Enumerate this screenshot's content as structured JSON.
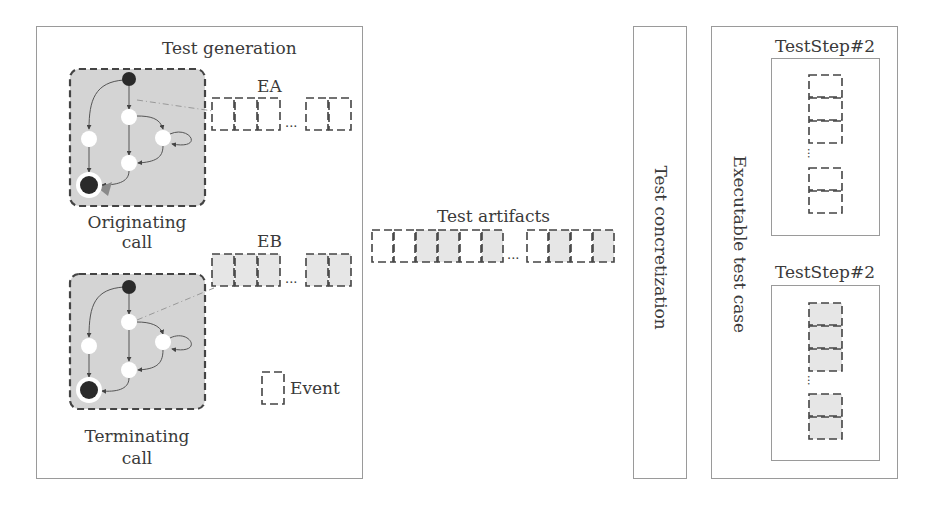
{
  "test_generation": {
    "title": "Test generation",
    "originating": {
      "caption_line1": "Originating",
      "caption_line2": "call",
      "events_label": "EA",
      "events_before_ellipsis": [
        "empty",
        "empty",
        "empty"
      ],
      "events_after_ellipsis": [
        "empty",
        "empty"
      ],
      "ellipsis": "..."
    },
    "terminating": {
      "caption_line1": "Terminating",
      "caption_line2": "call",
      "events_label": "EB",
      "events_before_ellipsis": [
        "filled",
        "filled",
        "filled"
      ],
      "events_after_ellipsis": [
        "filled",
        "filled"
      ],
      "ellipsis": "..."
    },
    "legend": {
      "label": "Event"
    }
  },
  "test_artifacts": {
    "title": "Test artifacts",
    "events_before_ellipsis": [
      "empty",
      "empty",
      "filled",
      "filled",
      "empty",
      "filled"
    ],
    "events_after_ellipsis": [
      "empty",
      "filled",
      "empty",
      "filled"
    ],
    "ellipsis": "..."
  },
  "test_concretization": {
    "title": "Test concretization"
  },
  "executable_test_case": {
    "title": "Executable test case",
    "steps": [
      {
        "title": "TestStep#2",
        "events_before_ellipsis": [
          "empty",
          "empty",
          "empty"
        ],
        "events_after_ellipsis": [
          "empty",
          "empty"
        ],
        "ellipsis": "..."
      },
      {
        "title": "TestStep#2",
        "events_before_ellipsis": [
          "filled",
          "filled",
          "filled"
        ],
        "events_after_ellipsis": [
          "filled",
          "filled"
        ],
        "ellipsis": "..."
      }
    ]
  },
  "colors": {
    "panel_border": "#9a9a9a",
    "dashed_border": "#555555",
    "state_machine_fill": "#d4d4d4",
    "event_fill": "#e6e6e6",
    "node_dark": "#2a2a2a",
    "link_line": "#999999"
  }
}
